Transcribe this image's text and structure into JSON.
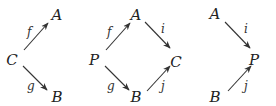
{
  "diagrams": [
    {
      "name": "span",
      "nodes": [
        {
          "id": "C",
          "label": "C",
          "x": 12,
          "y": 65
        },
        {
          "id": "A",
          "label": "A",
          "x": 57,
          "y": 20
        },
        {
          "id": "B",
          "label": "B",
          "x": 57,
          "y": 102
        }
      ],
      "arrows": [
        {
          "from": "C",
          "to": "A",
          "label": "f",
          "x1": 24,
          "y1": 50,
          "x2": 48,
          "y2": 23,
          "lx": 27,
          "ly": 36
        },
        {
          "from": "C",
          "to": "B",
          "label": "g",
          "x1": 23,
          "y1": 66,
          "x2": 47,
          "y2": 90,
          "lx": 27,
          "ly": 90
        }
      ]
    },
    {
      "name": "square",
      "nodes": [
        {
          "id": "P",
          "label": "P",
          "x": 94,
          "y": 65
        },
        {
          "id": "A",
          "label": "A",
          "x": 136,
          "y": 20
        },
        {
          "id": "C",
          "label": "C",
          "x": 176,
          "y": 67
        },
        {
          "id": "B",
          "label": "B",
          "x": 136,
          "y": 102
        }
      ],
      "arrows": [
        {
          "from": "P",
          "to": "A",
          "label": "f",
          "x1": 106,
          "y1": 50,
          "x2": 130,
          "y2": 23,
          "lx": 107,
          "ly": 36
        },
        {
          "from": "P",
          "to": "B",
          "label": "g",
          "x1": 105,
          "y1": 66,
          "x2": 129,
          "y2": 90,
          "lx": 107,
          "ly": 90
        },
        {
          "from": "A",
          "to": "C",
          "label": "i",
          "x1": 145,
          "y1": 22,
          "x2": 170,
          "y2": 48,
          "lx": 161,
          "ly": 33
        },
        {
          "from": "B",
          "to": "C",
          "label": "j",
          "x1": 147,
          "y1": 91,
          "x2": 170,
          "y2": 66,
          "lx": 161,
          "ly": 90
        }
      ]
    },
    {
      "name": "cospan",
      "nodes": [
        {
          "id": "A",
          "label": "A",
          "x": 215,
          "y": 19
        },
        {
          "id": "P",
          "label": "P",
          "x": 254,
          "y": 65
        },
        {
          "id": "B",
          "label": "B",
          "x": 215,
          "y": 102
        }
      ],
      "arrows": [
        {
          "from": "A",
          "to": "P",
          "label": "i",
          "x1": 225,
          "y1": 22,
          "x2": 250,
          "y2": 48,
          "lx": 244,
          "ly": 33
        },
        {
          "from": "B",
          "to": "P",
          "label": "j",
          "x1": 228,
          "y1": 91,
          "x2": 251,
          "y2": 66,
          "lx": 244,
          "ly": 90
        }
      ]
    }
  ]
}
